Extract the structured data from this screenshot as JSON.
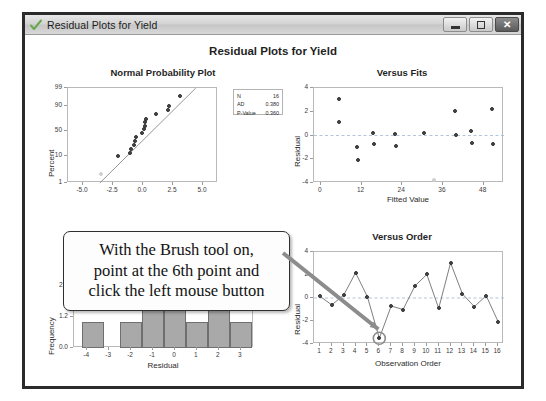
{
  "window": {
    "title": "Residual Plots for Yield",
    "icon": "check-icon",
    "buttons": {
      "minimize": "minimize",
      "maximize": "maximize",
      "close": "✕"
    }
  },
  "main_title": "Residual Plots for Yield",
  "callout": {
    "line1": "With the Brush tool on,",
    "line2": "point at the 6th point and",
    "line3": "click the left mouse button"
  },
  "annotation": {
    "arrow_color": "#8c8c8c",
    "highlight_point_order": 6,
    "highlight_point_value": -3.5
  },
  "stats": {
    "rows": [
      {
        "key": "N",
        "value": "16"
      },
      {
        "key": "AD",
        "value": "0.380"
      },
      {
        "key": "P-Value",
        "value": "0.360"
      }
    ]
  },
  "chart_data": [
    {
      "type": "scatter",
      "title": "Normal Probability Plot",
      "xlabel": "",
      "ylabel": "Percent",
      "xlim": [
        -6.25,
        6.25
      ],
      "ylim": [
        1,
        99
      ],
      "xticks": [
        "-5.0",
        "-2.5",
        "0.0",
        "2.5",
        "5.0"
      ],
      "xtickvals": [
        -5.0,
        -2.5,
        0.0,
        2.5,
        5.0
      ],
      "yticks": [
        "1",
        "10",
        "50",
        "90",
        "99"
      ],
      "ytickvals": [
        1,
        10,
        50,
        90,
        99
      ],
      "grid": false,
      "points": [
        {
          "x": -3.5,
          "y": 4,
          "faded": true
        },
        {
          "x": -2.05,
          "y": 10
        },
        {
          "x": -1.05,
          "y": 16
        },
        {
          "x": -1.0,
          "y": 22
        },
        {
          "x": -0.75,
          "y": 28
        },
        {
          "x": -0.7,
          "y": 34
        },
        {
          "x": -0.6,
          "y": 41
        },
        {
          "x": -0.1,
          "y": 47
        },
        {
          "x": 0.1,
          "y": 53
        },
        {
          "x": 0.15,
          "y": 59
        },
        {
          "x": 0.2,
          "y": 64
        },
        {
          "x": 0.25,
          "y": 69
        },
        {
          "x": 1.1,
          "y": 78
        },
        {
          "x": 2.1,
          "y": 84
        },
        {
          "x": 2.2,
          "y": 90
        },
        {
          "x": 3.1,
          "y": 95
        }
      ],
      "fit_line": {
        "x1": -3.6,
        "y1": 1,
        "x2": 4.4,
        "y2": 99
      }
    },
    {
      "type": "scatter",
      "title": "Versus Fits",
      "xlabel": "Fitted Value",
      "ylabel": "Residual",
      "xlim": [
        -2,
        54
      ],
      "ylim": [
        -4,
        4
      ],
      "xticks": [
        "0",
        "12",
        "24",
        "36",
        "48"
      ],
      "xtickvals": [
        0,
        12,
        24,
        36,
        48
      ],
      "yticks": [
        "-4",
        "-2",
        "0",
        "2",
        "4"
      ],
      "ytickvals": [
        -4,
        -2,
        0,
        2,
        4
      ],
      "zero_line": 0,
      "points": [
        {
          "x": 5.5,
          "y": 3.05
        },
        {
          "x": 5.5,
          "y": 1.15
        },
        {
          "x": 10.8,
          "y": -1.0
        },
        {
          "x": 11.0,
          "y": -2.05
        },
        {
          "x": 15.3,
          "y": 0.2
        },
        {
          "x": 15.6,
          "y": -0.75
        },
        {
          "x": 22.0,
          "y": 0.1
        },
        {
          "x": 22.2,
          "y": -0.85
        },
        {
          "x": 30.5,
          "y": 0.2
        },
        {
          "x": 33.5,
          "y": -3.75,
          "faded": true
        },
        {
          "x": 39.5,
          "y": 2.1
        },
        {
          "x": 39.8,
          "y": 0.08
        },
        {
          "x": 44.3,
          "y": 0.35
        },
        {
          "x": 44.5,
          "y": -0.6
        },
        {
          "x": 50.5,
          "y": 2.2
        },
        {
          "x": 50.8,
          "y": -0.75
        }
      ]
    },
    {
      "type": "bar",
      "title": "Histogram",
      "xlabel": "Residual",
      "ylabel": "Frequency",
      "categories": [
        "-4",
        "-3",
        "-2",
        "-1",
        "0",
        "1",
        "2",
        "3"
      ],
      "bin_centers": [
        -3.75,
        -2.0,
        -1.0,
        0.0,
        1.0,
        2.0,
        3.0
      ],
      "values": [
        1,
        1,
        3,
        3,
        1,
        2,
        1
      ],
      "xticks": [
        "-4",
        "-3",
        "-2",
        "-1",
        "0",
        "1",
        "2",
        "3"
      ],
      "xtickvals": [
        -4,
        -3,
        -2,
        -1,
        0,
        1,
        2,
        3
      ],
      "yticks": [
        "0.0",
        "1.2",
        "2.4"
      ],
      "ytickvals": [
        0.0,
        1.2,
        2.4
      ],
      "ylim": [
        0,
        3.1
      ],
      "bar_color": "#a9a9a9"
    },
    {
      "type": "line",
      "title": "Versus Order",
      "xlabel": "Observation Order",
      "ylabel": "Residual",
      "x": [
        1,
        2,
        3,
        4,
        5,
        6,
        7,
        8,
        9,
        10,
        11,
        12,
        13,
        14,
        15,
        16
      ],
      "xticks": [
        "1",
        "2",
        "3",
        "4",
        "5",
        "6",
        "7",
        "8",
        "9",
        "10",
        "11",
        "12",
        "13",
        "14",
        "15",
        "16"
      ],
      "values": [
        0.15,
        -0.6,
        0.25,
        2.2,
        0.1,
        -3.5,
        -0.7,
        -1.0,
        1.05,
        2.05,
        -0.9,
        3.05,
        0.35,
        -0.75,
        0.2,
        -2.05
      ],
      "yticks": [
        "-4",
        "-2",
        "0",
        "2",
        "4"
      ],
      "ytickvals": [
        -4,
        -2,
        0,
        2,
        4
      ],
      "ylim": [
        -4,
        4
      ],
      "zero_line": 0
    }
  ]
}
